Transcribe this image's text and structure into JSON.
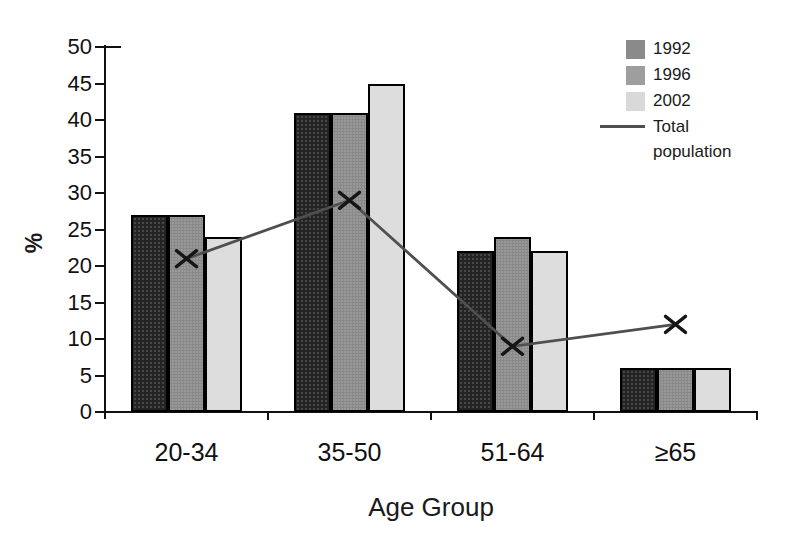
{
  "chart_data": {
    "type": "bar",
    "title": "",
    "xlabel": "Age Group",
    "ylabel": "%",
    "categories": [
      "20-34",
      "35-50",
      "51-64",
      "≥65"
    ],
    "series": [
      {
        "name": "1992",
        "values": [
          27,
          41,
          22,
          6
        ],
        "color": "#242424",
        "legend_color": "#8a8a8a"
      },
      {
        "name": "1996",
        "values": [
          27,
          41,
          24,
          6
        ],
        "color": "#999999",
        "legend_color": "#9e9e9e"
      },
      {
        "name": "2002",
        "values": [
          24,
          45,
          22,
          6
        ],
        "color": "#dddddd",
        "legend_color": "#d9d9d9"
      }
    ],
    "line_series": {
      "name": "Total population",
      "values": [
        21,
        29,
        9,
        12
      ],
      "color": "#4f4f4f",
      "marker": "x",
      "marker_color": "#151515"
    },
    "ylim": [
      0,
      50
    ],
    "ytick_step": 5,
    "yticks": [
      0,
      5,
      10,
      15,
      20,
      25,
      30,
      35,
      40,
      45,
      50
    ],
    "grid": false,
    "legend_position": "top-right",
    "axis_color": "#111111",
    "background": "#ffffff"
  }
}
